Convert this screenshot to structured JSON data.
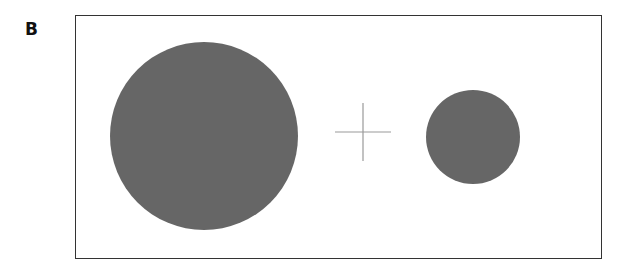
{
  "panel": {
    "label": "B"
  },
  "stimulus": {
    "frame": {
      "x": 75,
      "y": 15,
      "width": 527,
      "height": 244,
      "stroke": "#333333"
    },
    "fixation_cross": {
      "cx": 363,
      "cy": 132,
      "half_width": 28,
      "half_height": 29,
      "stroke": "#999999"
    },
    "circles": [
      {
        "name": "large-circle",
        "cx": 204,
        "cy": 136,
        "r": 94,
        "fill": "#666666"
      },
      {
        "name": "small-circle",
        "cx": 473,
        "cy": 137,
        "r": 47,
        "fill": "#666666"
      }
    ]
  }
}
